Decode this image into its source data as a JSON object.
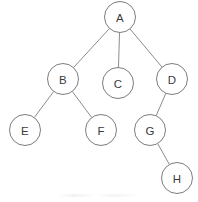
{
  "diagram": {
    "type": "tree",
    "title": "",
    "canvas": {
      "width": 198,
      "height": 202
    },
    "style": {
      "background_color": "#ffffff",
      "node_fill": "#ffffff",
      "node_stroke": "#7d7d7d",
      "edge_color": "#8c8c8c",
      "label_color": "#3b3b3b",
      "node_radius": 15.5,
      "stroke_width": 1
    },
    "nodes": [
      {
        "id": "A",
        "label": "A",
        "cx": 120,
        "cy": 17,
        "r": 15.5
      },
      {
        "id": "B",
        "label": "B",
        "cx": 63,
        "cy": 79,
        "r": 15.5
      },
      {
        "id": "C",
        "label": "C",
        "cx": 118,
        "cy": 83,
        "r": 15.5
      },
      {
        "id": "D",
        "label": "D",
        "cx": 172,
        "cy": 79,
        "r": 15.5
      },
      {
        "id": "E",
        "label": "E",
        "cx": 25,
        "cy": 130,
        "r": 15.5
      },
      {
        "id": "F",
        "label": "F",
        "cx": 101,
        "cy": 130,
        "r": 15.5
      },
      {
        "id": "G",
        "label": "G",
        "cx": 150,
        "cy": 130,
        "r": 15.5
      },
      {
        "id": "H",
        "label": "H",
        "cx": 177,
        "cy": 178,
        "r": 15.5
      }
    ],
    "edges": [
      {
        "id": "A-B",
        "from": "A",
        "to": "B",
        "label": ""
      },
      {
        "id": "A-C",
        "from": "A",
        "to": "C",
        "label": ""
      },
      {
        "id": "A-D",
        "from": "A",
        "to": "D",
        "label": ""
      },
      {
        "id": "B-E",
        "from": "B",
        "to": "E",
        "label": ""
      },
      {
        "id": "B-F",
        "from": "B",
        "to": "F",
        "label": ""
      },
      {
        "id": "D-G",
        "from": "D",
        "to": "G",
        "label": ""
      },
      {
        "id": "G-H",
        "from": "G",
        "to": "H",
        "label": ""
      }
    ],
    "root": "A",
    "levels": [
      {
        "depth": 0,
        "node_ids": [
          "A"
        ]
      },
      {
        "depth": 1,
        "node_ids": [
          "B",
          "C",
          "D"
        ]
      },
      {
        "depth": 2,
        "node_ids": [
          "E",
          "F",
          "G"
        ]
      },
      {
        "depth": 3,
        "node_ids": [
          "H"
        ]
      }
    ]
  }
}
